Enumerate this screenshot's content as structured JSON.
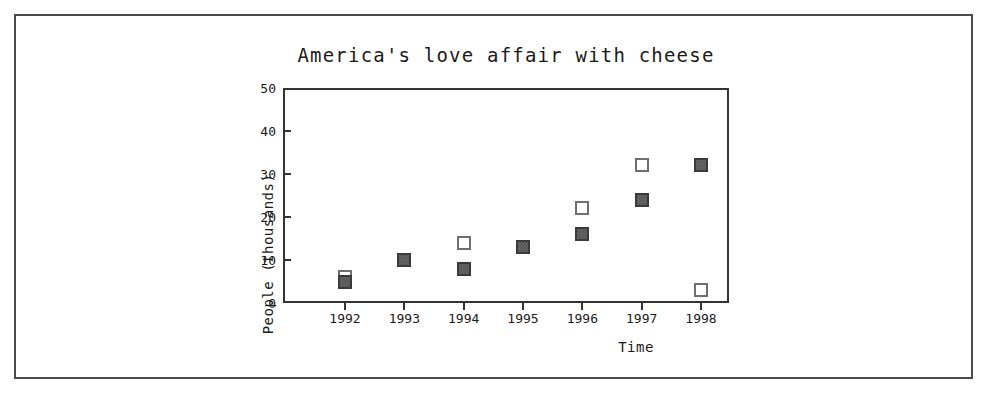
{
  "chart_data": {
    "type": "scatter",
    "title": "America's love affair with cheese",
    "xlabel": "Time",
    "ylabel": "People (thousands)",
    "categories": [
      "1992",
      "1993",
      "1994",
      "1995",
      "1996",
      "1997",
      "1998"
    ],
    "xticklabels": [
      "1992",
      "1993",
      "1994",
      "1995",
      "1996",
      "1997",
      "1998"
    ],
    "yticklabels": [
      "0",
      "10",
      "20",
      "30",
      "40",
      "50"
    ],
    "ytickvalues": [
      0,
      10,
      20,
      30,
      40,
      50
    ],
    "ylim": [
      0,
      50
    ],
    "grid": false,
    "legend": "none",
    "series": [
      {
        "name": "open-square-series",
        "marker": "open-square",
        "values": [
          6,
          10,
          14,
          13,
          22,
          32,
          3
        ]
      },
      {
        "name": "filled-square-series",
        "marker": "filled-square",
        "values": [
          5,
          10,
          8,
          13,
          16,
          24,
          32
        ]
      }
    ]
  },
  "colors": {
    "frame": "#333333",
    "text": "#1a1a1a",
    "open_marker_edge": "#6f6f6f",
    "filled_marker": "#6a6a6a",
    "page_border": "#4a4a4a",
    "background": "#ffffff"
  }
}
